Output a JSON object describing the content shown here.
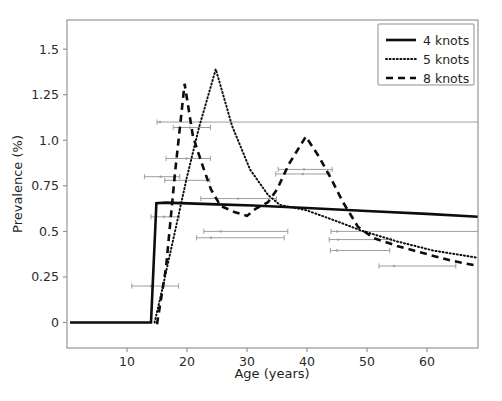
{
  "chart_data": {
    "type": "line",
    "title": "",
    "xlabel": "Age (years)",
    "ylabel": "Prevalence (%)",
    "xlim": [
      0,
      68.5
    ],
    "ylim": [
      -0.14,
      1.66
    ],
    "xticks": [
      10,
      20,
      30,
      40,
      50,
      60
    ],
    "xtick_labels": [
      "10",
      "20",
      "30",
      "40",
      "50",
      "60"
    ],
    "yticks": [
      0,
      0.25,
      0.5,
      0.75,
      1.0,
      1.25,
      1.5
    ],
    "ytick_labels": [
      "0",
      "0.25",
      "0.5",
      "0.75",
      "1.0",
      "1.25",
      "1.5"
    ],
    "grid": false,
    "legend_position": "upper right",
    "series": [
      {
        "name": "4 knots",
        "style": "solid",
        "color": "#0d0d0d",
        "points": [
          [
            0.5,
            0.0
          ],
          [
            14.0,
            0.0
          ],
          [
            14.9,
            0.655
          ],
          [
            16.5,
            0.658
          ],
          [
            25.0,
            0.648
          ],
          [
            31.0,
            0.642
          ],
          [
            40.0,
            0.628
          ],
          [
            50.0,
            0.612
          ],
          [
            60.0,
            0.596
          ],
          [
            68.5,
            0.58
          ]
        ]
      },
      {
        "name": "5 knots",
        "style": "dotted",
        "color": "#0d0d0d",
        "points": [
          [
            14.6,
            0.0
          ],
          [
            16.0,
            0.2
          ],
          [
            18.0,
            0.5
          ],
          [
            20.0,
            0.8
          ],
          [
            22.0,
            1.07
          ],
          [
            24.8,
            1.39
          ],
          [
            27.5,
            1.08
          ],
          [
            30.5,
            0.84
          ],
          [
            33.5,
            0.7
          ],
          [
            35.5,
            0.645
          ],
          [
            40.0,
            0.615
          ],
          [
            45.0,
            0.555
          ],
          [
            49.0,
            0.505
          ],
          [
            55.0,
            0.445
          ],
          [
            61.0,
            0.395
          ],
          [
            68.5,
            0.355
          ]
        ]
      },
      {
        "name": "8 knots",
        "style": "dashed",
        "color": "#0d0d0d",
        "points": [
          [
            15.0,
            -0.01
          ],
          [
            16.5,
            0.3
          ],
          [
            18.0,
            0.82
          ],
          [
            19.6,
            1.31
          ],
          [
            21.0,
            1.02
          ],
          [
            22.5,
            0.87
          ],
          [
            24.0,
            0.73
          ],
          [
            25.6,
            0.64
          ],
          [
            28.0,
            0.605
          ],
          [
            30.0,
            0.585
          ],
          [
            31.5,
            0.625
          ],
          [
            33.5,
            0.66
          ],
          [
            35.0,
            0.73
          ],
          [
            37.0,
            0.87
          ],
          [
            39.8,
            1.02
          ],
          [
            42.0,
            0.91
          ],
          [
            44.0,
            0.79
          ],
          [
            46.0,
            0.66
          ],
          [
            48.5,
            0.525
          ],
          [
            51.0,
            0.465
          ],
          [
            55.0,
            0.42
          ],
          [
            60.0,
            0.375
          ],
          [
            64.0,
            0.34
          ],
          [
            68.5,
            0.31
          ]
        ]
      }
    ],
    "error_bars": [
      {
        "y": 0.2,
        "x_start": 10.8,
        "x_end": 18.6,
        "x_center": 14.0
      },
      {
        "y": 0.58,
        "x_start": 14.0,
        "x_end": 18.7,
        "x_center": 16.2
      },
      {
        "y": 0.8,
        "x_start": 12.9,
        "x_end": 18.8,
        "x_center": 15.6
      },
      {
        "y": 0.9,
        "x_start": 16.5,
        "x_end": 23.9,
        "x_center": 19.9
      },
      {
        "y": 0.78,
        "x_start": 16.3,
        "x_end": 23.8,
        "x_center": 19.8
      },
      {
        "y": 1.1,
        "x_start": 15.0,
        "x_end": 68.5,
        "x_center": 15.5
      },
      {
        "y": 1.07,
        "x_start": 17.7,
        "x_end": 23.9,
        "x_center": 20.5
      },
      {
        "y": 0.68,
        "x_start": 22.3,
        "x_end": 34.9,
        "x_center": 28.5
      },
      {
        "y": 0.5,
        "x_start": 22.8,
        "x_end": 36.8,
        "x_center": 25.6
      },
      {
        "y": 0.465,
        "x_start": 21.6,
        "x_end": 36.2,
        "x_center": 24.0
      },
      {
        "y": 0.84,
        "x_start": 35.2,
        "x_end": 44.2,
        "x_center": 39.5
      },
      {
        "y": 0.815,
        "x_start": 34.8,
        "x_end": 43.8,
        "x_center": 39.3
      },
      {
        "y": 0.5,
        "x_start": 44.0,
        "x_end": 68.5,
        "x_center": 45.0
      },
      {
        "y": 0.455,
        "x_start": 43.7,
        "x_end": 54.0,
        "x_center": 45.2
      },
      {
        "y": 0.395,
        "x_start": 43.9,
        "x_end": 53.8,
        "x_center": 45.0
      },
      {
        "y": 0.31,
        "x_start": 52.0,
        "x_end": 64.8,
        "x_center": 54.5
      }
    ],
    "legend_entries": [
      {
        "label": "4 knots",
        "style": "solid"
      },
      {
        "label": "5 knots",
        "style": "dotted"
      },
      {
        "label": "8 knots",
        "style": "dashed"
      }
    ]
  }
}
